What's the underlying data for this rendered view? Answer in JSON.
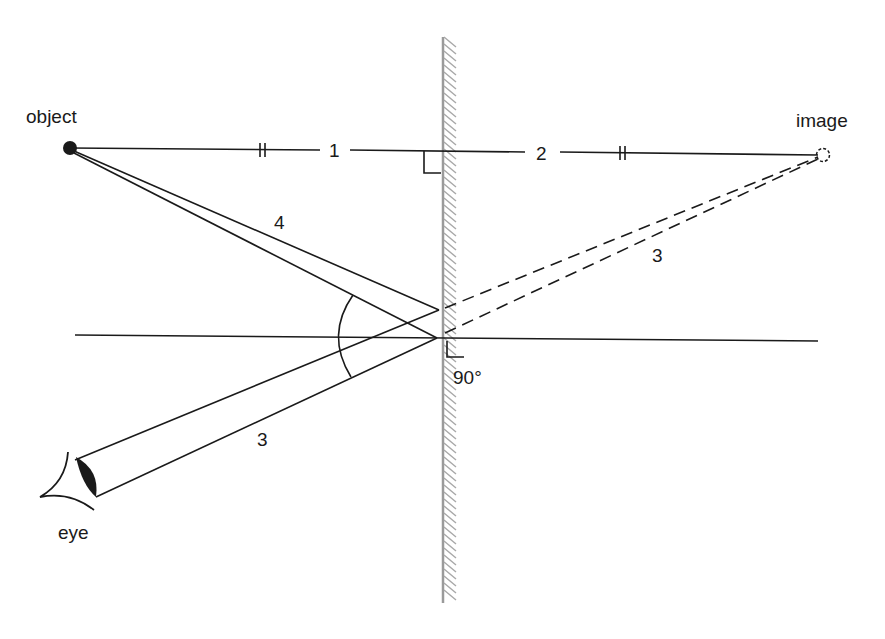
{
  "diagram": {
    "labels": {
      "object": "object",
      "image": "image",
      "eye": "eye",
      "distance_object": "1",
      "distance_image": "2",
      "reflected_ray": "3",
      "reflected_ray_virtual": "3",
      "incident_ray": "4",
      "normal_angle": "90°"
    },
    "colors": {
      "line": "#1a1a1a",
      "mirror": "#9a9a9a",
      "hatching": "#a8a8a8",
      "background": "#ffffff"
    }
  }
}
